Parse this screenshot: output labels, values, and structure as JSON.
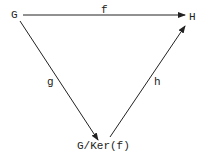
{
  "diagram": {
    "nodes": {
      "G": "G",
      "H": "H",
      "quotient": "G/Ker(f)"
    },
    "arrows": {
      "f": "f",
      "g": "g",
      "h": "h"
    },
    "colors": {
      "ink": "#222222",
      "background": "#ffffff"
    }
  }
}
